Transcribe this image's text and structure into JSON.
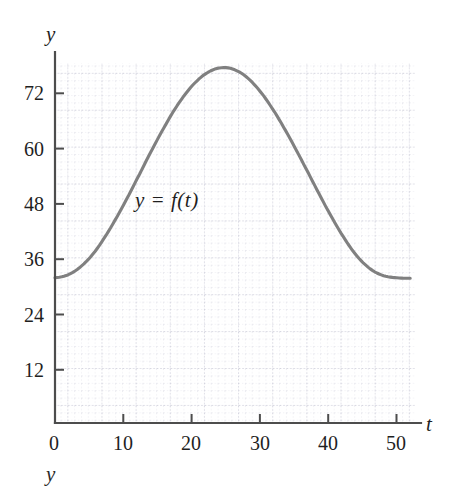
{
  "figure": {
    "background_color": "#ffffff",
    "curve_color": "#808080",
    "axis_color": "#555555",
    "grid_color": "#cfcfdc",
    "grid_major_color": "#b9b9cc",
    "text_color": "#1f1f1f"
  },
  "axes": {
    "y_axis_name": "y",
    "x_axis_name": "t",
    "stray_label": "y"
  },
  "curve_annotation": {
    "text": "y = f(t)"
  },
  "chart_data": {
    "type": "line",
    "title": "",
    "xlabel": "t",
    "ylabel": "y",
    "xlim": [
      0,
      52
    ],
    "ylim": [
      0,
      80
    ],
    "xticks": [
      0,
      10,
      20,
      30,
      40,
      50
    ],
    "xtick_labels": [
      "0",
      "10",
      "20",
      "30",
      "40",
      "50"
    ],
    "yticks": [
      12,
      24,
      36,
      48,
      60,
      72
    ],
    "ytick_labels": [
      "12",
      "24",
      "36",
      "48",
      "60",
      "72"
    ],
    "grid": true,
    "grid_minor_step_x": 1,
    "grid_major_step_x": 5,
    "grid_minor_step_y": 1.6,
    "grid_major_step_y": 8,
    "legend": "none",
    "series": [
      {
        "name": "y = f(t)",
        "color": "#808080",
        "approx_formula": "y = 54.2 - 22.7*cos(2*pi*t/51)",
        "x": [
          0,
          2,
          4,
          6,
          8,
          10,
          12,
          14,
          16,
          18,
          20,
          22,
          24,
          26,
          28,
          30,
          32,
          34,
          36,
          38,
          40,
          42,
          44,
          46,
          48,
          50,
          52
        ],
        "values": [
          31.5,
          32.2,
          34.2,
          37.5,
          42.0,
          47.2,
          52.9,
          58.7,
          64.2,
          69.1,
          73.0,
          75.7,
          77.0,
          76.8,
          75.1,
          72.0,
          67.8,
          62.8,
          57.3,
          51.6,
          46.0,
          40.9,
          36.6,
          33.6,
          32.0,
          31.5,
          31.4
        ],
        "minimum": {
          "t": 0,
          "y": 31.5
        },
        "maximum": {
          "t": 25,
          "y": 77.0
        }
      }
    ]
  },
  "geometry": {
    "origin_x": 55,
    "origin_y": 423,
    "plot_right": 415,
    "plot_top": 63,
    "px_per_t": 6.83,
    "px_per_y": 4.61
  }
}
